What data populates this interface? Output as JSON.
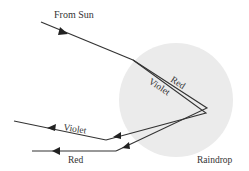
{
  "diagram": {
    "title_label": "From Sun",
    "drop_label": "Raindrop",
    "inside_red_label": "Red",
    "inside_violet_label": "Violet",
    "exit_violet_label": "Violet",
    "exit_red_label": "Red",
    "colors": {
      "drop_fill": "#ebebeb",
      "ray": "#333333",
      "text": "#333333"
    }
  }
}
